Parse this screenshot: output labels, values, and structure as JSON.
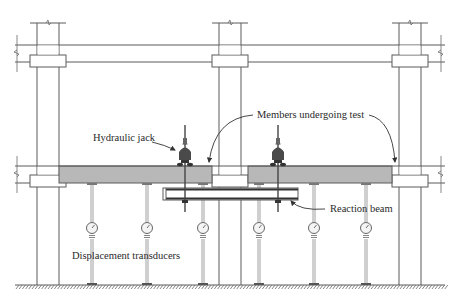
{
  "diagram": {
    "labels": {
      "hydraulic_jack": "Hydraulic jack",
      "members_under_test": "Members undergoing test",
      "reaction_beam": "Reaction beam",
      "displacement_transducers": "Displacement transducers"
    },
    "components": {
      "columns": 3,
      "hydraulic_jacks": 2,
      "displacement_transducers": 6,
      "tested_members": 2,
      "reaction_beams": 1
    },
    "colors": {
      "line": "#5a5a5a",
      "slab_fill": "#b8b8b8",
      "jack_fill": "#4a4a4a",
      "background": "#ffffff"
    }
  }
}
